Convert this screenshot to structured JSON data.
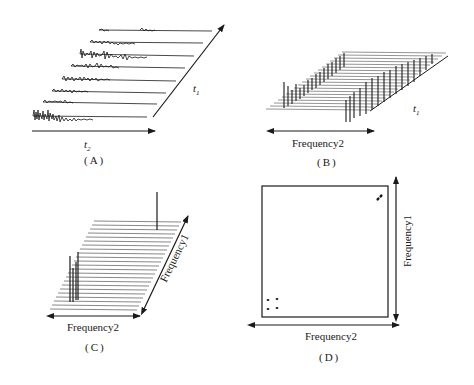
{
  "panels": {
    "A": {
      "caption": "(A)",
      "axis_x_label": "t",
      "axis_x_sub": "2",
      "axis_y_label": "t",
      "axis_y_sub": "1",
      "description": "Stack of time-domain FID traces along t2, stepped along t1"
    },
    "B": {
      "caption": "(B)",
      "axis_x_label": "Frequency2",
      "axis_y_label": "t",
      "axis_y_sub": "1",
      "description": "Spectra after first Fourier transform, stacked along t1"
    },
    "C": {
      "caption": "(C)",
      "axis_x_label": "Frequency2",
      "axis_y_label": "Frequency1",
      "description": "Stacked plot after second Fourier transform"
    },
    "D": {
      "caption": "(D)",
      "axis_x_label": "Frequency2",
      "axis_y_label": "Frequency1",
      "description": "2D contour map with diagonal and cross peaks"
    }
  },
  "colors": {
    "ink": "#1a1a1a",
    "plane": "#555555",
    "background": "#ffffff"
  }
}
